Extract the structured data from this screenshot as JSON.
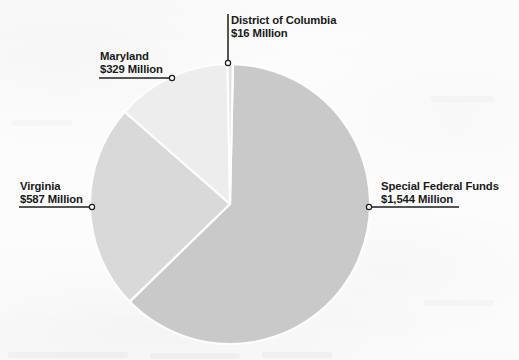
{
  "chart_data": {
    "type": "pie",
    "title": "",
    "subtitle": "",
    "xlabel": "",
    "ylabel": "",
    "units": "Million",
    "currency": "$",
    "legend_position": "callout-labels",
    "grid": false,
    "categories": [
      "Special Federal Funds",
      "Virginia",
      "Maryland",
      "District of Columbia"
    ],
    "values": [
      1544,
      587,
      329,
      16
    ],
    "total": 2476,
    "slices": [
      {
        "name": "Special Federal Funds",
        "value": 1544,
        "value_label": "$1,544 Million",
        "percent": 62.4,
        "color": "#c9c9c9",
        "start_angle": 1.2,
        "end_angle": 225.8,
        "label_side": "right"
      },
      {
        "name": "Virginia",
        "value": 587,
        "value_label": "$587 Million",
        "percent": 23.7,
        "color": "#d9d9d9",
        "start_angle": 225.8,
        "end_angle": 311.2,
        "label_side": "left"
      },
      {
        "name": "Maryland",
        "value": 329,
        "value_label": "$329 Million",
        "percent": 13.3,
        "color": "#ededed",
        "start_angle": 311.2,
        "end_angle": 359.0,
        "label_side": "left"
      },
      {
        "name": "District of Columbia",
        "value": 16,
        "value_label": "$16 Million",
        "percent": 0.6,
        "color": "#e2e2e2",
        "start_angle": 359.0,
        "end_angle": 361.2,
        "label_side": "top"
      }
    ],
    "geometry": {
      "center_x": 230,
      "center_y": 204,
      "radius": 140,
      "slice_gap_degrees": 1.1
    }
  },
  "callouts": {
    "dc": {
      "name": "District of Columbia",
      "value_label": "$16 Million",
      "text_x": 231,
      "text_y": 14,
      "leader": {
        "type": "vertical",
        "x": 228,
        "y1": 14,
        "y2": 63
      }
    },
    "maryland": {
      "name": "Maryland",
      "value_label": "$329 Million",
      "text_x": 100,
      "text_y": 50,
      "leader": {
        "type": "underline-right",
        "x1": 99,
        "x2": 172,
        "y": 78
      }
    },
    "virginia": {
      "name": "Virginia",
      "value_label": "$587 Million",
      "text_x": 20,
      "text_y": 180,
      "leader": {
        "type": "underline-right",
        "x1": 19,
        "x2": 92,
        "y": 207
      }
    },
    "special_federal_funds": {
      "name": "Special Federal Funds",
      "value_label": "$1,544 Million",
      "text_x": 381,
      "text_y": 180,
      "leader": {
        "type": "underline-left",
        "x1": 369,
        "x2": 459,
        "y": 207
      }
    }
  },
  "style": {
    "text_color": "#19191b",
    "leader_color": "#1c1c1e",
    "connector_fill": "#fdfdfd",
    "background": "#fdfdfd"
  }
}
